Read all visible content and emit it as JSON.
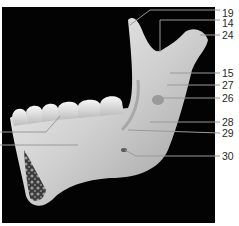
{
  "figure": {
    "background_color": "#030303",
    "bone_color": "#d8d8d8",
    "leader_color": "#8a8a8a"
  },
  "labels": [
    {
      "number": "19",
      "y": 13
    },
    {
      "number": "14",
      "y": 23
    },
    {
      "number": "24",
      "y": 35
    },
    {
      "number": "15",
      "y": 73
    },
    {
      "number": "27",
      "y": 85
    },
    {
      "number": "26",
      "y": 98
    },
    {
      "number": "28",
      "y": 122
    },
    {
      "number": "29",
      "y": 133
    },
    {
      "number": "30",
      "y": 156
    }
  ]
}
